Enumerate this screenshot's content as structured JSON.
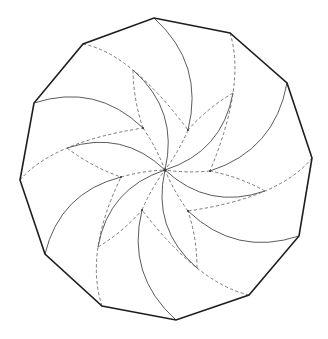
{
  "figure": {
    "type": "crease-pattern",
    "polygon_sides": 12,
    "rotational_symmetry": 6,
    "blades": 6,
    "colors": {
      "background": "#ffffff",
      "outline": "#1e1e1e",
      "solid_fold": "#4a4a4a",
      "dashed_fold": "#6a6a6a",
      "junction": "#333333"
    },
    "line_types": {
      "outline": "polygon-border",
      "solid": "mountain-fold",
      "dashed": "valley-fold"
    },
    "connections_per_blade": [
      {
        "from": "outer-vertex-odd",
        "to": "inner-point",
        "style": "solid"
      },
      {
        "from": "outer-vertex-even",
        "to": "inner-point-next",
        "via": "mid-point",
        "style": "dashed"
      },
      {
        "from": "mid-point",
        "to": "inner-point",
        "style": "dashed"
      },
      {
        "from": "mid-point",
        "to": "center",
        "style": "solid"
      },
      {
        "from": "inner-point",
        "to": "center",
        "style": "dashed"
      }
    ]
  }
}
